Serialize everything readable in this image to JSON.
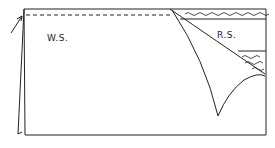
{
  "diagram": {
    "labels": {
      "wrong_side": "W.S.",
      "right_side": "R.S."
    },
    "colors": {
      "ink": "#222222",
      "paper": "#ffffff"
    }
  }
}
